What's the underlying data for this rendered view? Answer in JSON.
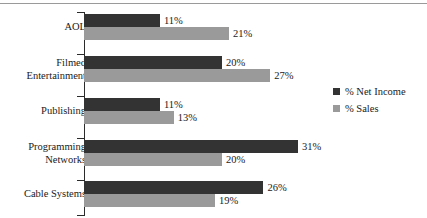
{
  "chart_data": {
    "type": "bar",
    "orientation": "horizontal",
    "title": "",
    "xlabel": "",
    "ylabel": "",
    "grid": false,
    "legend_position": "right",
    "xlim": [
      0,
      31
    ],
    "categories": [
      "AOL",
      "Filmed\nEntertainment",
      "Publishing",
      "Programming\nNetworks",
      "Cable Systems"
    ],
    "series": [
      {
        "name": "% Net Income",
        "color": "#333333",
        "values": [
          11,
          20,
          11,
          31,
          26
        ],
        "labels": [
          "11%",
          "20%",
          "11%",
          "31%",
          "26%"
        ]
      },
      {
        "name": "% Sales",
        "color": "#9a9a9a",
        "values": [
          21,
          27,
          13,
          20,
          19
        ],
        "labels": [
          "21%",
          "27%",
          "13%",
          "20%",
          "19%"
        ]
      }
    ]
  },
  "legend": {
    "items": [
      {
        "label": "% Net Income",
        "swatch": "net"
      },
      {
        "label": "% Sales",
        "swatch": "sales"
      }
    ]
  }
}
